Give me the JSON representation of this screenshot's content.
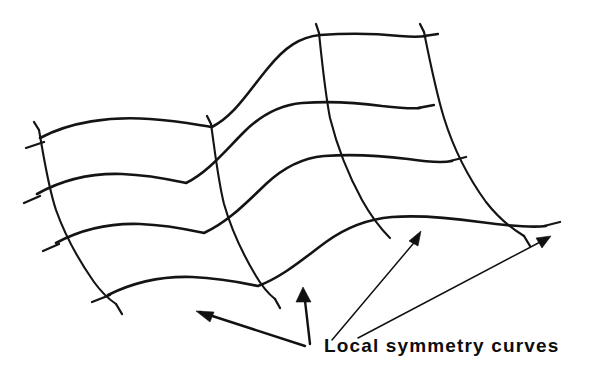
{
  "figure": {
    "kind": "hand-drawn-diagram",
    "title": "Local symmetry curves",
    "background_color": "#ffffff",
    "ink_color": "#141414",
    "caption": {
      "text": "Local symmetry curves",
      "x": 324,
      "y": 336,
      "font_size_px": 19,
      "font_weight": "bold",
      "letter_spacing_px": 1.15,
      "color": "#0d0d0d"
    },
    "mesh": {
      "description": "Curvilinear 4-by-4 mesh drawn as a wavy surface patch in oblique projection",
      "horizontal_curve_count": 4,
      "vertical_curve_count": 4,
      "stroke_width_horizontal": 2.6,
      "stroke_width_vertical": 2.1,
      "horizontal_curves": [
        {
          "name": "h1-top",
          "d": "M 40 138 C 70 122 110 116 150 119 C 180 121 198 125 212 127 C 235 115 248 92 268 68 C 285 47 300 37 320 35 C 350 33 380 34 400 36 C 412 37 420 37 426 36"
        },
        {
          "name": "h2",
          "d": "M 37 194 C 62 180 92 173 122 174 C 150 175 172 180 186 183 C 208 172 224 152 244 132 C 262 114 280 105 302 103 C 330 101 360 103 382 106 C 400 108 412 109 420 108"
        },
        {
          "name": "h3",
          "d": "M 56 243 C 80 230 110 223 140 224 C 168 225 190 230 204 233 C 228 222 246 203 266 184 C 284 167 302 158 324 156 C 352 154 384 156 408 159 C 428 162 442 163 452 161"
        },
        {
          "name": "h4-bottom",
          "d": "M 108 295 C 132 283 162 276 192 277 C 220 278 244 283 258 286 C 284 276 304 258 326 242 C 348 226 368 219 392 217 C 420 215 452 218 480 222 C 510 226 530 228 546 226"
        }
      ],
      "vertical_curves": [
        {
          "name": "v1-left",
          "d": "M 39 130 C 44 158 48 186 56 210 C 66 238 80 262 94 282 C 102 293 110 300 116 304"
        },
        {
          "name": "v2",
          "d": "M 211 124 C 215 152 218 180 224 204 C 232 232 244 256 256 276 C 263 288 270 295 275 299"
        },
        {
          "name": "v3",
          "d": "M 319 33 C 322 62 325 92 330 118 C 338 150 350 178 362 200 C 372 218 382 230 390 238"
        },
        {
          "name": "v4-right",
          "d": "M 424 32 C 430 62 436 92 444 118 C 454 150 470 180 486 202 C 500 220 514 230 524 236"
        }
      ],
      "tick_marks": [
        {
          "name": "tick-h1-left",
          "d": "M 44 142 L 26 148"
        },
        {
          "name": "tick-h1-right",
          "d": "M 424 36 L 438 34"
        },
        {
          "name": "tick-h2-left",
          "d": "M 40 196 L 24 203"
        },
        {
          "name": "tick-h2-right",
          "d": "M 418 108 L 434 105"
        },
        {
          "name": "tick-h3-left",
          "d": "M 59 244 L 43 251"
        },
        {
          "name": "tick-h3-right",
          "d": "M 450 161 L 466 157"
        },
        {
          "name": "tick-h4-left",
          "d": "M 110 295 L 92 302"
        },
        {
          "name": "tick-h4-right",
          "d": "M 544 226 L 560 222"
        },
        {
          "name": "tick-v1-top",
          "d": "M 39 130 L 34 122"
        },
        {
          "name": "tick-v1-bot",
          "d": "M 116 304 L 122 314"
        },
        {
          "name": "tick-v2-top",
          "d": "M 211 124 L 207 116"
        },
        {
          "name": "tick-v2-bot",
          "d": "M 275 299 L 280 308"
        },
        {
          "name": "tick-v3-top",
          "d": "M 319 33 L 316 24"
        },
        {
          "name": "tick-v4-top",
          "d": "M 424 32 L 420 24"
        },
        {
          "name": "tick-v4-bot",
          "d": "M 524 236 L 530 246"
        }
      ]
    },
    "arrows": [
      {
        "name": "arrow-to-lower-left-curve",
        "weight": "thick",
        "tail": {
          "x": 305,
          "y": 346
        },
        "tip": {
          "x": 196,
          "y": 311
        },
        "head_points": "196,311 214,312 210,322",
        "path": "M 305 346 L 200 312"
      },
      {
        "name": "arrow-to-lower-middle-node",
        "weight": "thick",
        "tail": {
          "x": 310,
          "y": 344
        },
        "tip": {
          "x": 303,
          "y": 287
        },
        "head_points": "303,287 296,302 311,302",
        "path": "M 310 344 L 304 292"
      },
      {
        "name": "arrow-to-right-node",
        "weight": "thin",
        "tail": {
          "x": 332,
          "y": 340
        },
        "tip": {
          "x": 421,
          "y": 231
        },
        "head_points": "421,231 409,241 418,246",
        "path": "M 332 340 L 418 238"
      },
      {
        "name": "arrow-to-far-right-node",
        "weight": "thin",
        "tail": {
          "x": 358,
          "y": 338
        },
        "tip": {
          "x": 551,
          "y": 236
        },
        "head_points": "551,236 536,238 542,248",
        "path": "M 358 338 L 544 240"
      }
    ]
  }
}
